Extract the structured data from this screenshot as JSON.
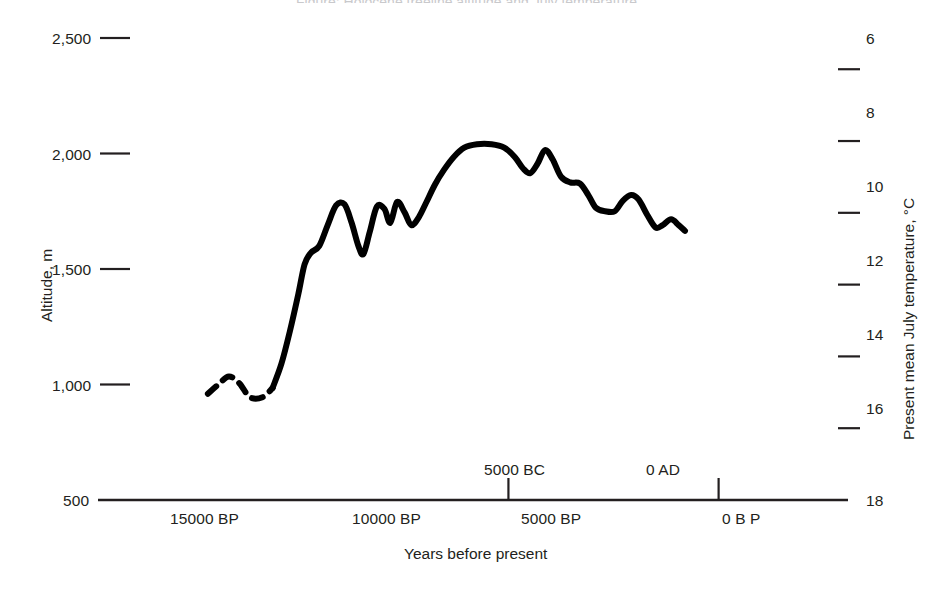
{
  "figure": {
    "clipped_title": "Figure: Holocene treeline altitude and July temperature"
  },
  "axes": {
    "left": {
      "title": "Altitude, m",
      "ticks": [
        "2,500",
        "2,000",
        "1,500",
        "1,000",
        "500"
      ]
    },
    "right": {
      "title": "Present mean July temperature, °C",
      "ticks": [
        "6",
        "8",
        "10",
        "12",
        "14",
        "16",
        "18"
      ]
    },
    "bottom": {
      "title": "Years before present",
      "ticks_below": [
        "15000 BP",
        "10000 BP",
        "5000 BP",
        "0 B P"
      ],
      "ticks_above": [
        "5000 BC",
        "0 AD"
      ]
    }
  },
  "chart_data": {
    "type": "line",
    "title": "",
    "xlabel": "Years before present",
    "ylabel": "Altitude, m",
    "y2label": "Present mean July temperature, °C",
    "xlim": [
      16500,
      -700
    ],
    "ylim": [
      500,
      2500
    ],
    "y2lim": [
      18,
      5.13
    ],
    "x_reversed": true,
    "y2_reversed": true,
    "grid": false,
    "legend": null,
    "axis_ticks": {
      "y": [
        500,
        1000,
        1500,
        2000,
        2500
      ],
      "y2": [
        6,
        8,
        10,
        12,
        14,
        16,
        18
      ],
      "x_below": [
        15000,
        10000,
        5000,
        0
      ],
      "x_above": [
        {
          "label": "5000 BC",
          "bp": 6950
        },
        {
          "label": "0 AD",
          "bp": 1950
        }
      ]
    },
    "line_color": "#000000",
    "line_width_px": 6,
    "segments": [
      {
        "name": "late-glacial-uncertain",
        "style": "dashed",
        "points": [
          {
            "bp": 14100,
            "alt": 960
          },
          {
            "bp": 13850,
            "alt": 1000
          },
          {
            "bp": 13600,
            "alt": 1035
          },
          {
            "bp": 13350,
            "alt": 1005
          },
          {
            "bp": 13100,
            "alt": 945
          },
          {
            "bp": 12800,
            "alt": 945
          },
          {
            "bp": 12560,
            "alt": 985
          }
        ]
      },
      {
        "name": "holocene-record",
        "style": "solid",
        "points": [
          {
            "bp": 12560,
            "alt": 985
          },
          {
            "bp": 12350,
            "alt": 1090
          },
          {
            "bp": 12150,
            "alt": 1230
          },
          {
            "bp": 11950,
            "alt": 1390
          },
          {
            "bp": 11800,
            "alt": 1520
          },
          {
            "bp": 11650,
            "alt": 1570
          },
          {
            "bp": 11450,
            "alt": 1600
          },
          {
            "bp": 11250,
            "alt": 1690
          },
          {
            "bp": 11050,
            "alt": 1775
          },
          {
            "bp": 10850,
            "alt": 1780
          },
          {
            "bp": 10680,
            "alt": 1700
          },
          {
            "bp": 10520,
            "alt": 1600
          },
          {
            "bp": 10400,
            "alt": 1565
          },
          {
            "bp": 10250,
            "alt": 1660
          },
          {
            "bp": 10080,
            "alt": 1770
          },
          {
            "bp": 9900,
            "alt": 1760
          },
          {
            "bp": 9760,
            "alt": 1700
          },
          {
            "bp": 9600,
            "alt": 1790
          },
          {
            "bp": 9420,
            "alt": 1745
          },
          {
            "bp": 9260,
            "alt": 1690
          },
          {
            "bp": 9080,
            "alt": 1725
          },
          {
            "bp": 8900,
            "alt": 1790
          },
          {
            "bp": 8700,
            "alt": 1865
          },
          {
            "bp": 8480,
            "alt": 1930
          },
          {
            "bp": 8250,
            "alt": 1985
          },
          {
            "bp": 8000,
            "alt": 2025
          },
          {
            "bp": 7700,
            "alt": 2040
          },
          {
            "bp": 7350,
            "alt": 2040
          },
          {
            "bp": 7050,
            "alt": 2025
          },
          {
            "bp": 6800,
            "alt": 1985
          },
          {
            "bp": 6600,
            "alt": 1935
          },
          {
            "bp": 6430,
            "alt": 1915
          },
          {
            "bp": 6260,
            "alt": 1955
          },
          {
            "bp": 6080,
            "alt": 2015
          },
          {
            "bp": 5900,
            "alt": 1975
          },
          {
            "bp": 5700,
            "alt": 1900
          },
          {
            "bp": 5480,
            "alt": 1875
          },
          {
            "bp": 5250,
            "alt": 1870
          },
          {
            "bp": 5050,
            "alt": 1820
          },
          {
            "bp": 4870,
            "alt": 1765
          },
          {
            "bp": 4650,
            "alt": 1750
          },
          {
            "bp": 4420,
            "alt": 1750
          },
          {
            "bp": 4230,
            "alt": 1795
          },
          {
            "bp": 4030,
            "alt": 1820
          },
          {
            "bp": 3850,
            "alt": 1800
          },
          {
            "bp": 3650,
            "alt": 1735
          },
          {
            "bp": 3450,
            "alt": 1680
          },
          {
            "bp": 3280,
            "alt": 1690
          },
          {
            "bp": 3080,
            "alt": 1715
          },
          {
            "bp": 2900,
            "alt": 1690
          },
          {
            "bp": 2750,
            "alt": 1665
          }
        ]
      }
    ]
  }
}
